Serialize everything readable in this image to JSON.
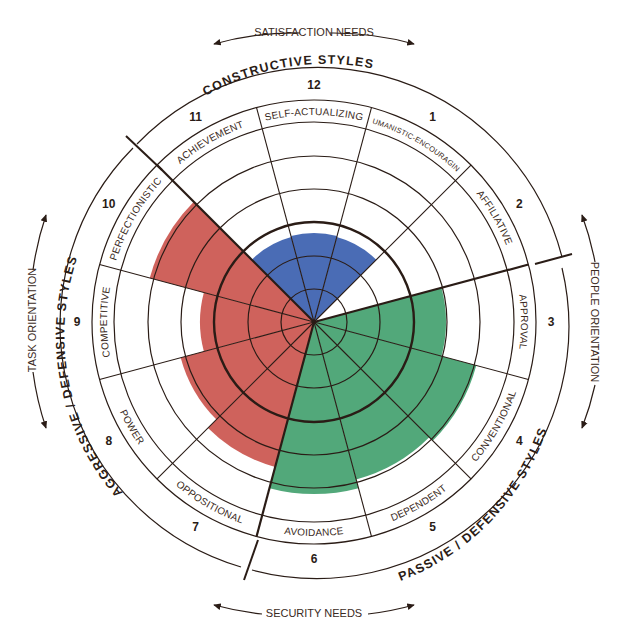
{
  "diagram": {
    "center": [
      314,
      322
    ],
    "ring_radii": [
      33,
      66,
      100,
      133,
      166,
      200,
      222
    ],
    "outer_arc_radius": 255,
    "colors": {
      "constructive": "#4a6cb5",
      "passive_defensive": "#52a87a",
      "aggressive_defensive": "#cf625c",
      "line": "#2a1c16"
    },
    "styles": [
      {
        "num": "12",
        "name": "SELF-ACTUALIZING",
        "cluster": "constructive",
        "value": 89
      },
      {
        "num": "1",
        "name": "HUMANISTIC-ENCOURAGING",
        "cluster": "constructive",
        "value": 88
      },
      {
        "num": "2",
        "name": "AFFILIATIVE",
        "cluster": "constructive",
        "value": 0
      },
      {
        "num": "3",
        "name": "APPROVAL",
        "cluster": "passive_defensive",
        "value": 132
      },
      {
        "num": "4",
        "name": "CONVENTIONAL",
        "cluster": "passive_defensive",
        "value": 168
      },
      {
        "num": "5",
        "name": "DEPENDENT",
        "cluster": "passive_defensive",
        "value": 163
      },
      {
        "num": "6",
        "name": "AVOIDANCE",
        "cluster": "passive_defensive",
        "value": 172
      },
      {
        "num": "7",
        "name": "OPPOSITIONAL",
        "cluster": "aggressive_defensive",
        "value": 150
      },
      {
        "num": "8",
        "name": "POWER",
        "cluster": "aggressive_defensive",
        "value": 138
      },
      {
        "num": "9",
        "name": "COMPETITIVE",
        "cluster": "aggressive_defensive",
        "value": 114
      },
      {
        "num": "10",
        "name": "PERFECTIONISTIC",
        "cluster": "aggressive_defensive",
        "value": 170
      },
      {
        "num": "11",
        "name": "ACHIEVEMENT",
        "cluster": "constructive",
        "value": 88
      }
    ],
    "cluster_labels": {
      "constructive": "CONSTRUCTIVE STYLES",
      "passive_defensive": "PASSIVE / DEFENSIVE STYLES",
      "aggressive_defensive": "AGGRESSIVE / DEFENSIVE STYLES"
    },
    "axis_labels": {
      "top": "SATISFACTION NEEDS",
      "bottom": "SECURITY NEEDS",
      "left": "TASK ORIENTATION",
      "right": "PEOPLE ORIENTATION"
    }
  }
}
